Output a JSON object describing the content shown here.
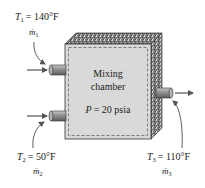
{
  "diagram": {
    "chamber": {
      "title_line1": "Mixing",
      "title_line2": "chamber",
      "pressure_label": "P",
      "pressure_value": "= 20 psia"
    },
    "inlet1": {
      "temp_var": "T",
      "temp_sub": "1",
      "temp_value": "= 140°F",
      "flow_var": "ṁ",
      "flow_sub": "1"
    },
    "inlet2": {
      "temp_var": "T",
      "temp_sub": "2",
      "temp_value": "= 50°F",
      "flow_var": "ṁ",
      "flow_sub": "2"
    },
    "outlet": {
      "temp_var": "T",
      "temp_sub": "3",
      "temp_value": "= 110°F",
      "flow_var": "ṁ",
      "flow_sub": "3"
    },
    "colors": {
      "front_face": "#d9d9d9",
      "insulation": "#6e6e6e",
      "pipe": "#8a8a8a",
      "dashed_boundary": "#555555",
      "arrow": "#555555",
      "text": "#222222"
    }
  }
}
